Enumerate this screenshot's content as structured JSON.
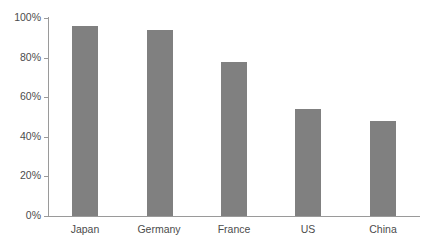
{
  "chart_data": {
    "type": "bar",
    "title": "",
    "subtitle": "",
    "xlabel": "",
    "ylabel": "",
    "categories": [
      "Japan",
      "Germany",
      "France",
      "US",
      "China"
    ],
    "values": [
      96,
      94,
      78,
      54,
      48
    ],
    "value_suffix": "%",
    "ylim": [
      0,
      100
    ],
    "ytick_values": [
      0,
      20,
      40,
      60,
      80,
      100
    ],
    "ytick_labels": [
      "0%",
      "20%",
      "40%",
      "60%",
      "80%",
      "100%"
    ],
    "grid": false,
    "legend": false,
    "legend_position": "none",
    "series": [
      {
        "name": "",
        "values": [
          96,
          94,
          78,
          54,
          48
        ]
      }
    ],
    "annotations": []
  },
  "style": {
    "bar_color": "#808080",
    "axis_color": "#9a9a9a",
    "text_color": "#4c4c4c",
    "background": "#ffffff"
  }
}
